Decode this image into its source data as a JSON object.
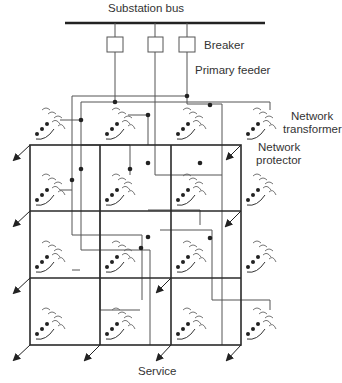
{
  "labels": {
    "substation_bus": "Substation bus",
    "breaker": "Breaker",
    "primary_feeder": "Primary feeder",
    "network_transformer_1": "Network",
    "network_transformer_2": "transformer",
    "network_protector_1": "Network",
    "network_protector_2": "protector",
    "service": "Service"
  },
  "components": {
    "breakers": 3,
    "feeders": 3,
    "network_grid": {
      "columns": 3,
      "rows": 3
    },
    "transformers": 16
  },
  "colors": {
    "line": "#333333",
    "grid": "#2a2a2a",
    "text": "#333333"
  }
}
